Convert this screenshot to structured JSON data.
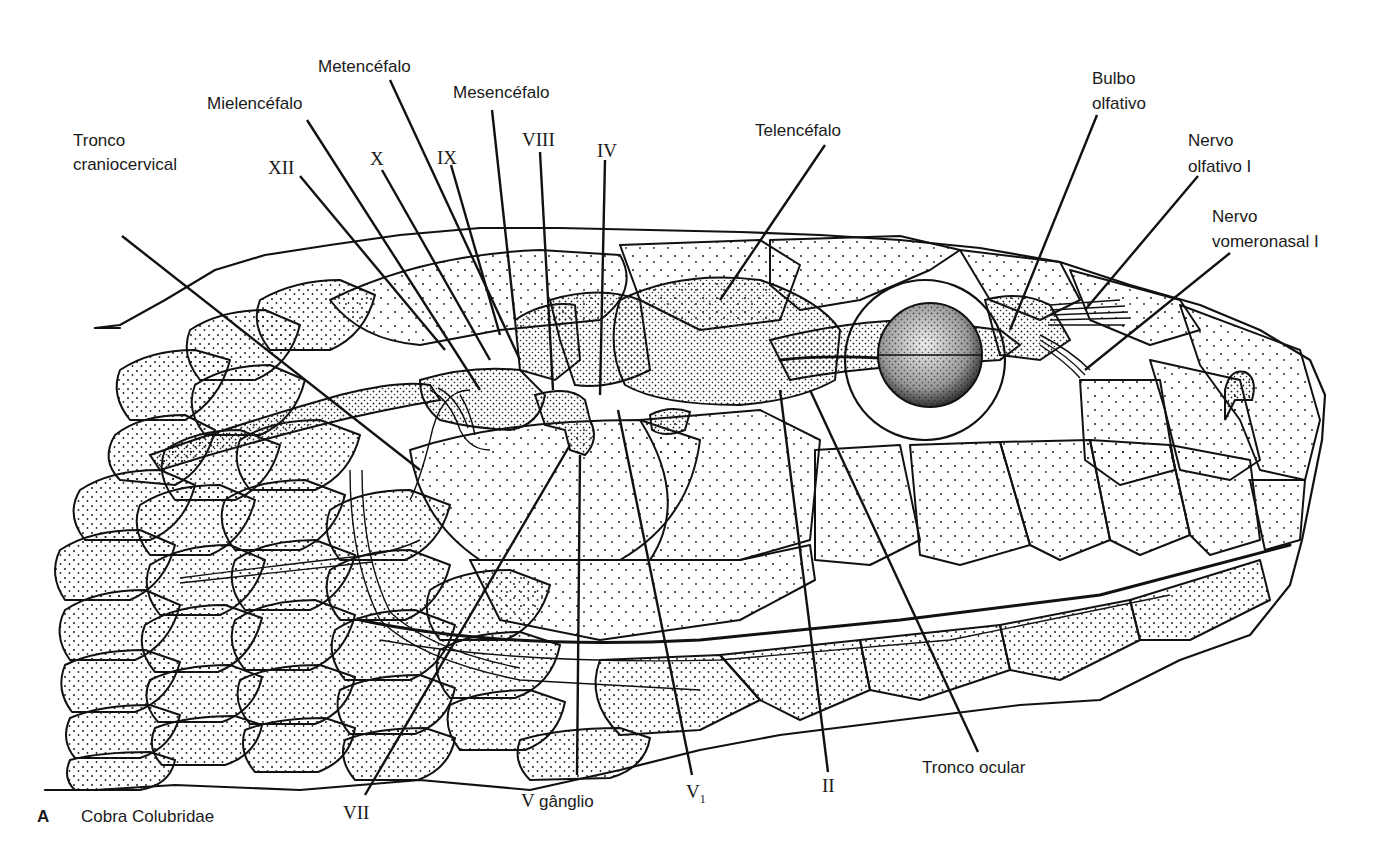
{
  "figure": {
    "panel_letter": "A",
    "caption": "Cobra Colubridae"
  },
  "labels": {
    "top": [
      {
        "id": "tronco-craniocervical",
        "lines": [
          "Tronco",
          "craniocervical"
        ],
        "style": "sans"
      },
      {
        "id": "mielencefalo",
        "lines": [
          "Mielencéfalo"
        ],
        "style": "sans"
      },
      {
        "id": "metencefalo",
        "lines": [
          "Metencéfalo"
        ],
        "style": "sans"
      },
      {
        "id": "mesencefalo",
        "lines": [
          "Mesencéfalo"
        ],
        "style": "sans"
      },
      {
        "id": "telencefalo",
        "lines": [
          "Telencéfalo"
        ],
        "style": "sans"
      },
      {
        "id": "bulbo-olfativo",
        "lines": [
          "Bulbo",
          "olfativo"
        ],
        "style": "sans"
      },
      {
        "id": "nervo-olfativo",
        "lines": [
          "Nervo",
          "olfativo I"
        ],
        "style": "sans"
      },
      {
        "id": "nervo-vomeronasal",
        "lines": [
          "Nervo",
          "vomeronasal I"
        ],
        "style": "sans"
      }
    ],
    "nerves_top": [
      {
        "id": "nerve-xii",
        "text": "XII"
      },
      {
        "id": "nerve-x",
        "text": "X"
      },
      {
        "id": "nerve-ix",
        "text": "IX"
      },
      {
        "id": "nerve-viii",
        "text": "VIII"
      },
      {
        "id": "nerve-iv",
        "text": "IV"
      }
    ],
    "bottom": [
      {
        "id": "nerve-vii",
        "text": "VII",
        "style": "serif"
      },
      {
        "id": "v-ganglio-prefix",
        "text": "V",
        "style": "serif"
      },
      {
        "id": "v-ganglio",
        "text": "gânglio",
        "style": "sans"
      },
      {
        "id": "nerve-v1",
        "text": "V",
        "sub": "1",
        "style": "serif"
      },
      {
        "id": "nerve-ii",
        "text": "II",
        "style": "serif"
      },
      {
        "id": "tronco-ocular",
        "text": "Tronco ocular",
        "style": "sans"
      }
    ]
  },
  "colors": {
    "ink": "#111111",
    "paper": "#ffffff"
  }
}
